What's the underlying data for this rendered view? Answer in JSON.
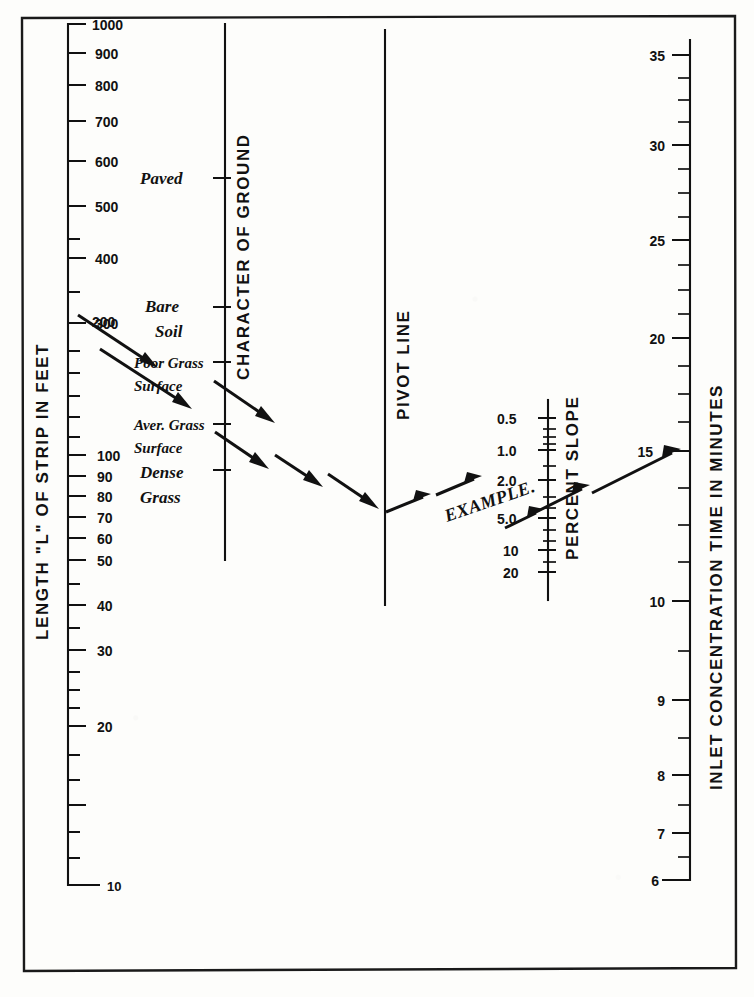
{
  "figure": {
    "kind": "nomograph",
    "ink_color": "#111111",
    "paper_color": "#fdfdfb"
  },
  "axes": {
    "length": {
      "title": "LENGTH \"L\" OF STRIP IN FEET",
      "labels": [
        "1000",
        "900",
        "800",
        "700",
        "600",
        "500",
        "400",
        "300",
        "200",
        "100",
        "90",
        "80",
        "70",
        "60",
        "50",
        "40",
        "30",
        "20",
        "10"
      ],
      "scale": "log",
      "range": [
        10,
        1000
      ],
      "top_value": 1000,
      "bottom_value": 10,
      "x": 68,
      "y_top": 24,
      "y_bottom": 885
    },
    "ground": {
      "title": "CHARACTER OF GROUND",
      "x": 225,
      "y_top": 24,
      "y_bottom": 560,
      "categories": [
        {
          "label": "Paved",
          "line2": "",
          "y": 178
        },
        {
          "label": "Bare",
          "line2": "Soil",
          "y": 307
        },
        {
          "label": "Poor Grass",
          "line2": "Surface",
          "y": 362
        },
        {
          "label": "Aver. Grass",
          "line2": "Surface",
          "y": 424
        },
        {
          "label": "Dense",
          "line2": "Grass",
          "y": 470
        }
      ]
    },
    "pivot": {
      "title": "PIVOT LINE",
      "x": 385,
      "y_top": 30,
      "y_bottom": 605
    },
    "slope": {
      "title": "PERCENT SLOPE",
      "labels": [
        "0.5",
        "1.0",
        "2.0",
        "5.0",
        "10",
        "20"
      ],
      "values": [
        0.5,
        1.0,
        2.0,
        5.0,
        10,
        20
      ],
      "inverted": true,
      "x": 548,
      "y_top": 413,
      "y_bottom": 572
    },
    "time": {
      "title": "INLET CONCENTRATION TIME IN MINUTES",
      "labels": [
        "35",
        "30",
        "25",
        "20",
        "15",
        "10",
        "9",
        "8",
        "7",
        "6"
      ],
      "values": [
        35,
        30,
        25,
        20,
        15,
        10,
        9,
        8,
        7,
        6
      ],
      "scale": "log",
      "range": [
        6,
        35
      ],
      "x": 690,
      "y_top": 55,
      "y_bottom": 880
    }
  },
  "example": {
    "label": "EXAMPLE.",
    "description_note": "dashed arrow chain: 200 ft on length scale to character-of-ground line, to pivot line, then to percent slope and the 15 minute reading",
    "readings": {
      "length_ft": 200,
      "ground_character": "Aver. Grass Surface",
      "percent_slope": 5.0,
      "inlet_concentration_time_min": 15
    }
  }
}
